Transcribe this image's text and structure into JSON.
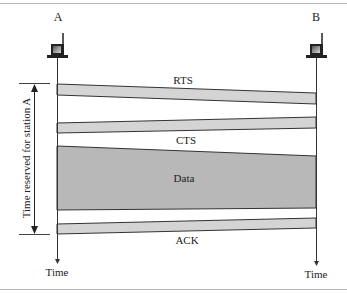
{
  "diagram": {
    "stations": [
      {
        "label": "A",
        "icon": "computer-icon",
        "x": 57
      },
      {
        "label": "B",
        "icon": "computer-icon",
        "x": 316
      }
    ],
    "frames": [
      {
        "label": "RTS",
        "direction": "A-to-B",
        "left_top": 84,
        "left_bottom": 95,
        "right_top": 93,
        "right_bottom": 104,
        "fill": "#d4d4d4"
      },
      {
        "label": "CTS",
        "direction": "B-to-A",
        "left_top": 123,
        "left_bottom": 133,
        "right_top": 117,
        "right_bottom": 128,
        "fill": "#d4d4d4"
      },
      {
        "label": "Data",
        "direction": "A-to-B",
        "left_top": 146,
        "left_bottom": 210,
        "right_top": 156,
        "right_bottom": 208,
        "fill": "#b8b8b8"
      },
      {
        "label": "ACK",
        "direction": "B-to-A",
        "left_top": 224,
        "left_bottom": 234,
        "right_top": 218,
        "right_bottom": 228,
        "fill": "#d4d4d4"
      }
    ],
    "reserved_time_label": "Time reserved for station A",
    "time_axis_labels": {
      "left": "Time",
      "right": "Time"
    },
    "colors": {
      "band_light": "#d4d4d4",
      "band_dark": "#b8b8b8",
      "line": "#333333",
      "frame": "#b8b8b8"
    }
  }
}
